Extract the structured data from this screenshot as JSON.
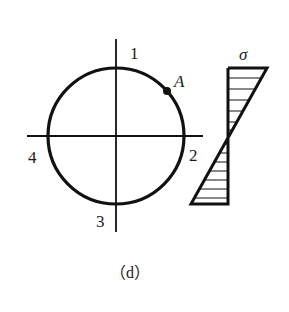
{
  "figure": {
    "caption": "（d）",
    "colors": {
      "stroke": "#111111",
      "background": "#ffffff"
    },
    "cross_section": {
      "shape": "circle",
      "center": [
        116,
        136
      ],
      "radius": 68,
      "point_labels": {
        "top": "1",
        "right": "2",
        "bottom": "3",
        "left": "4"
      },
      "marked_point": {
        "label": "A",
        "position": [
          167,
          91
        ]
      }
    },
    "stress_diagram": {
      "symbol": "σ",
      "type": "linear bending stress distribution",
      "neutral_axis_y": 136,
      "top_extent": "tension (right)",
      "bottom_extent": "compression (left)"
    }
  }
}
